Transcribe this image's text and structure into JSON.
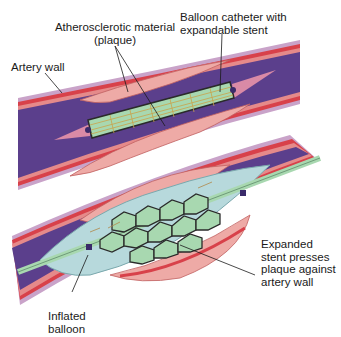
{
  "diagram": {
    "panels": [
      {
        "name": "before",
        "description": "Collapsed stent on balloon catheter inside narrowed artery"
      },
      {
        "name": "after",
        "description": "Inflated balloon expands stent against artery wall"
      }
    ],
    "labels": {
      "plaque_line1": "Atherosclerotic material",
      "plaque_line2": "(plaque)",
      "catheter_line1": "Balloon catheter with",
      "catheter_line2": "expandable stent",
      "artery_wall": "Artery wall",
      "expanded_line1": "Expanded",
      "expanded_line2": "stent presses",
      "expanded_line3": "plaque against",
      "expanded_line4": "artery wall",
      "balloon_line1": "Inflated",
      "balloon_line2": "balloon"
    },
    "colors": {
      "lumen": "#5b3f8c",
      "wall_outer": "#c9a3c9",
      "wall_red": "#d8414a",
      "plaque": "#eeaaa6",
      "balloon": "#b7d9dc",
      "stent_cell": "#a8d8b0",
      "stent_wire": "#2a2a2a"
    }
  }
}
